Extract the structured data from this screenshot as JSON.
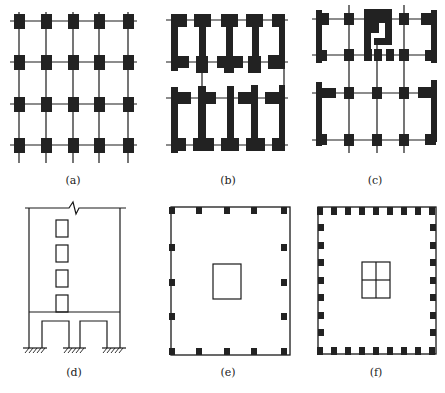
{
  "figure": {
    "panels": [
      {
        "id": "a",
        "caption": "(a)",
        "description": "Frame structure plan: 5x4 grid of square columns joined by beam lines"
      },
      {
        "id": "b",
        "caption": "(b)",
        "description": "Shear-wall plan: heavy wall segments forming I-shaped units"
      },
      {
        "id": "c",
        "caption": "(c)",
        "description": "Frame-shear wall plan: columns on grid with end walls and core"
      },
      {
        "id": "d",
        "caption": "(d)",
        "description": "Elevation: frame-supported shear wall with stacked openings, fixed supports"
      },
      {
        "id": "e",
        "caption": "(e)",
        "description": "Framed-tube plan: perimeter columns with central core"
      },
      {
        "id": "f",
        "caption": "(f)",
        "description": "Tube-in-tube plan: closely spaced perimeter columns with subdivided core"
      }
    ]
  },
  "colors": {
    "ink": "#1a1a1a",
    "fill": "#222222",
    "background": "#ffffff"
  }
}
